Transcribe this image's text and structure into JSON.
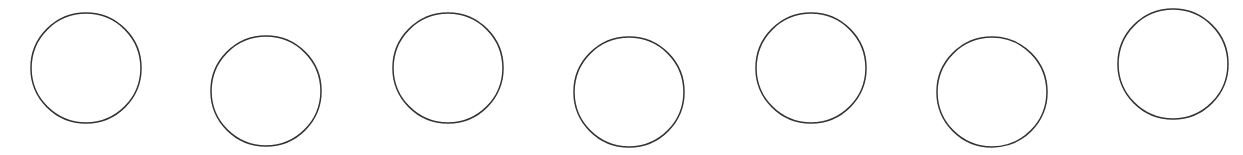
{
  "diagram": {
    "background": "#ffffff",
    "stroke_color": "#333333",
    "stroke_width": 1.5,
    "fill": "none",
    "circles": [
      {
        "cx": 86,
        "cy": 68,
        "r": 55
      },
      {
        "cx": 266,
        "cy": 91,
        "r": 55
      },
      {
        "cx": 448,
        "cy": 68,
        "r": 55
      },
      {
        "cx": 629,
        "cy": 92,
        "r": 55
      },
      {
        "cx": 811,
        "cy": 68,
        "r": 55
      },
      {
        "cx": 992,
        "cy": 92,
        "r": 55
      },
      {
        "cx": 1173,
        "cy": 64,
        "r": 55
      }
    ]
  }
}
